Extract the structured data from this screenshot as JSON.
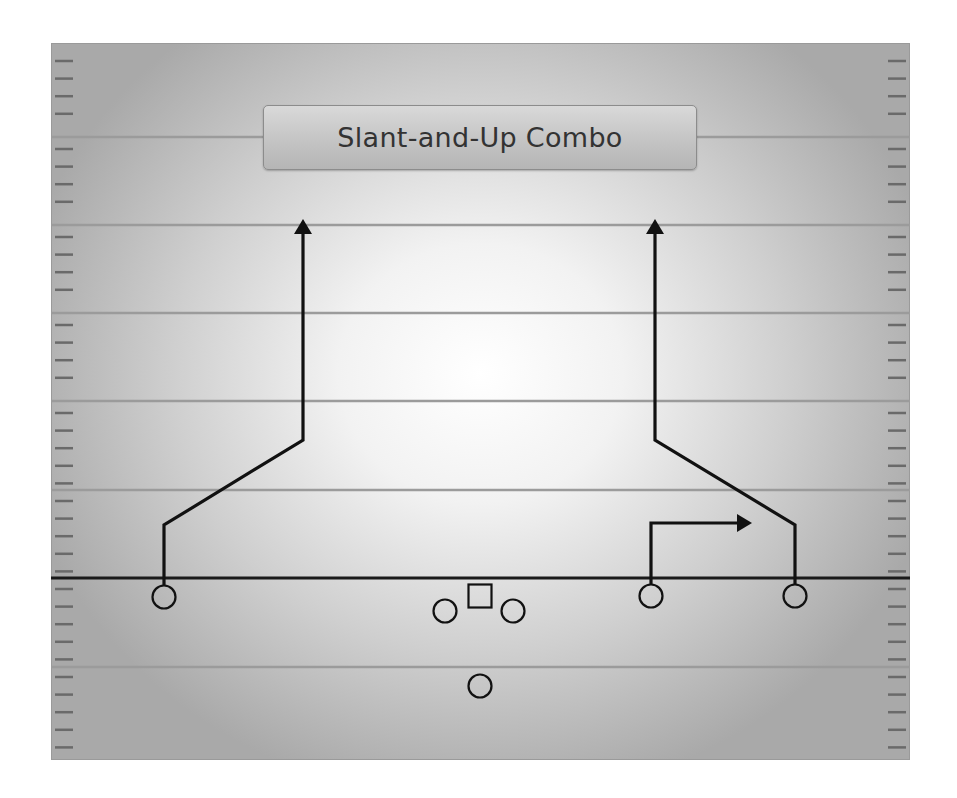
{
  "title": "Slant-and-Up Combo",
  "colors": {
    "yard_line": "#9b9b9b",
    "hash_mark": "#6a6a6a",
    "line_of_scrimmage": "#1a1a1a",
    "route": "#111111",
    "player_outline": "#111111"
  },
  "field": {
    "left": 51,
    "top": 43,
    "right": 910,
    "bottom": 760,
    "yard_lines_y": [
      137,
      225,
      313,
      401,
      490,
      667
    ],
    "line_of_scrimmage_y": 578,
    "hash_spacing": 17.6
  },
  "players": [
    {
      "role": "left-wide-receiver",
      "shape": "circle",
      "x": 164,
      "y": 597
    },
    {
      "role": "left-guard",
      "shape": "circle",
      "x": 445,
      "y": 611
    },
    {
      "role": "center",
      "shape": "square",
      "x": 480,
      "y": 596
    },
    {
      "role": "right-guard",
      "shape": "circle",
      "x": 513,
      "y": 611
    },
    {
      "role": "quarterback",
      "shape": "circle",
      "x": 480,
      "y": 686
    },
    {
      "role": "slot-receiver",
      "shape": "circle",
      "x": 651,
      "y": 596
    },
    {
      "role": "right-wide-receiver",
      "shape": "circle",
      "x": 795,
      "y": 596
    }
  ],
  "routes": [
    {
      "name": "left-slant-and-up",
      "points": [
        [
          164,
          585
        ],
        [
          164,
          525
        ],
        [
          303,
          440
        ],
        [
          303,
          232
        ]
      ],
      "arrow_tip": [
        303,
        219
      ]
    },
    {
      "name": "slot-out",
      "points": [
        [
          651,
          584
        ],
        [
          651,
          523
        ],
        [
          738,
          523
        ]
      ],
      "arrow_tip": [
        752,
        523
      ]
    },
    {
      "name": "right-slant-and-up",
      "points": [
        [
          795,
          584
        ],
        [
          795,
          525
        ],
        [
          655,
          440
        ],
        [
          655,
          232
        ]
      ],
      "arrow_tip": [
        655,
        219
      ]
    }
  ]
}
